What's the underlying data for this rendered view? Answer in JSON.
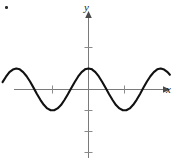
{
  "figure": {
    "title": "",
    "corner_bullet": "•",
    "background_color": "#ffffff",
    "curve_color": "#111111",
    "axis_color": "#7a7a7a",
    "tick_color": "#8a8a8a",
    "label_color": "#1a1a1a",
    "width": 177,
    "height": 163
  },
  "labels": {
    "x_axis": "x",
    "y_axis": "y"
  },
  "chart_data": {
    "type": "line",
    "title": "",
    "xlabel": "x",
    "ylabel": "y",
    "grid": false,
    "legend": null,
    "function": "y = cos(x)",
    "xlim": [
      -7.5,
      7.1
    ],
    "ylim": [
      -3.9,
      2.6
    ],
    "x_ticks": [
      -3.1416,
      3.1416
    ],
    "x_tick_labels": [
      "",
      ""
    ],
    "y_ticks": [
      -3,
      -2,
      -1,
      1,
      2
    ],
    "y_tick_labels": [
      "",
      "",
      "",
      "",
      ""
    ],
    "x": [
      -7.5,
      -7.2,
      -6.9,
      -6.6,
      -6.3,
      -6.0,
      -5.7,
      -5.4,
      -5.1,
      -4.8,
      -4.5,
      -4.2,
      -3.9,
      -3.6,
      -3.3,
      -3.0,
      -2.7,
      -2.4,
      -2.1,
      -1.8,
      -1.5,
      -1.2,
      -0.9,
      -0.6,
      -0.3,
      0.0,
      0.3,
      0.6,
      0.9,
      1.2,
      1.5,
      1.8,
      2.1,
      2.4,
      2.7,
      3.0,
      3.3,
      3.6,
      3.9,
      4.2,
      4.5,
      4.8,
      5.1,
      5.4,
      5.7,
      6.0,
      6.3,
      6.6,
      6.9,
      7.1
    ],
    "y": [
      0.35,
      0.61,
      0.83,
      0.95,
      1.0,
      0.96,
      0.83,
      0.63,
      0.38,
      0.09,
      -0.21,
      -0.49,
      -0.73,
      -0.9,
      -0.99,
      -0.99,
      -0.9,
      -0.74,
      -0.5,
      -0.23,
      0.07,
      0.36,
      0.62,
      0.83,
      0.96,
      1.0,
      0.96,
      0.83,
      0.62,
      0.36,
      0.07,
      -0.23,
      -0.5,
      -0.74,
      -0.9,
      -0.99,
      -0.99,
      -0.9,
      -0.73,
      -0.49,
      -0.21,
      0.09,
      0.38,
      0.63,
      0.83,
      0.96,
      1.0,
      0.95,
      0.83,
      0.7
    ],
    "maxima": [
      {
        "x": 0.0,
        "y": 1.0
      },
      {
        "x": -6.283,
        "y": 1.0
      },
      {
        "x": 6.283,
        "y": 1.0
      }
    ],
    "minima": [
      {
        "x": -3.1416,
        "y": -1.0
      },
      {
        "x": 3.1416,
        "y": -1.0
      }
    ],
    "zeros": [
      -4.712,
      -1.571,
      1.571,
      4.712
    ]
  }
}
